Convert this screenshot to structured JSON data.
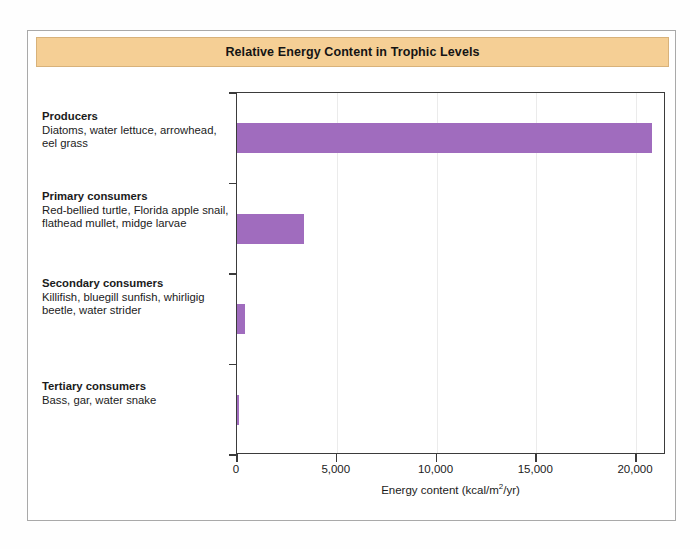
{
  "figure": {
    "title": "Relative Energy Content in Trophic Levels",
    "title_band_color": "#f5cf95",
    "bar_color": "#a06cbe",
    "frame_color": "#a9a9a9",
    "axis_color": "#3b3b3b"
  },
  "labels": [
    {
      "name": "Producers",
      "species": "Diatoms, water lettuce, arrowhead, eel grass"
    },
    {
      "name": "Primary consumers",
      "species": "Red-bellied turtle, Florida apple snail, flathead mullet, midge larvae"
    },
    {
      "name": "Secondary consumers",
      "species": "Killifish, bluegill sunfish, whirligig beetle, water strider"
    },
    {
      "name": "Tertiary consumers",
      "species": "Bass, gar, water snake"
    }
  ],
  "axis": {
    "ticks": [
      {
        "value": 0,
        "label": "0"
      },
      {
        "value": 5000,
        "label": "5,000"
      },
      {
        "value": 10000,
        "label": "10,000"
      },
      {
        "value": 15000,
        "label": "15,000"
      },
      {
        "value": 20000,
        "label": "20,000"
      }
    ],
    "title_prefix": "Energy content (kcal/m",
    "title_sup": "2",
    "title_suffix": "/yr)"
  },
  "chart_data": {
    "type": "bar",
    "orientation": "horizontal",
    "title": "Relative Energy Content in Trophic Levels",
    "xlabel": "Energy content (kcal/m2/yr)",
    "ylabel": "",
    "categories": [
      "Producers",
      "Primary consumers",
      "Secondary consumers",
      "Tertiary consumers"
    ],
    "values": [
      20810,
      3368,
      383,
      21
    ],
    "xlim": [
      0,
      21500
    ],
    "xticks": [
      0,
      5000,
      10000,
      15000,
      20000
    ],
    "xticklabels": [
      "0",
      "5,000",
      "10,000",
      "15,000",
      "20,000"
    ],
    "grid": true,
    "grid_axis": "x",
    "legend": false,
    "series_color": "#a06cbe"
  }
}
